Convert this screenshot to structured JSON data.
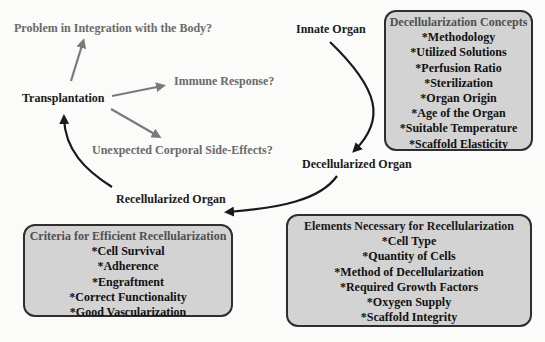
{
  "nodes": {
    "innate": "Innate Organ",
    "decellularized": "Decellularized Organ",
    "recellularized": "Recellularized Organ",
    "transplantation": "Transplantation"
  },
  "questions": {
    "integration": "Problem in Integration with the Body?",
    "immune": "Immune Response?",
    "side_effects": "Unexpected Corporal Side-Effects?"
  },
  "boxes": {
    "decell_concepts": {
      "title": "Decellularization Concepts",
      "items": [
        "*Methodology",
        "*Utilized Solutions",
        "*Perfusion Ratio",
        "*Sterilization",
        "*Organ Origin",
        "*Age of the Organ",
        "*Suitable Temperature",
        "*Scaffold Elasticity"
      ]
    },
    "recell_elements": {
      "title": "Elements Necessary for Recellularization",
      "items": [
        "*Cell Type",
        "*Quantity of Cells",
        "*Method of Decellularization",
        "*Required Growth Factors",
        "*Oxygen Supply",
        "*Scaffold Integrity"
      ]
    },
    "recell_criteria": {
      "title": "Criteria for Efficient Recellularization",
      "items": [
        "*Cell Survival",
        "*Adherence",
        "*Engraftment",
        "*Correct Functionality",
        "*Good Vascularization"
      ]
    }
  },
  "colors": {
    "box_fill": "#d3d3d3",
    "box_border": "#2e2e2e",
    "question_text": "#6a6a6a",
    "gray_arrow": "#7a7a7a"
  }
}
